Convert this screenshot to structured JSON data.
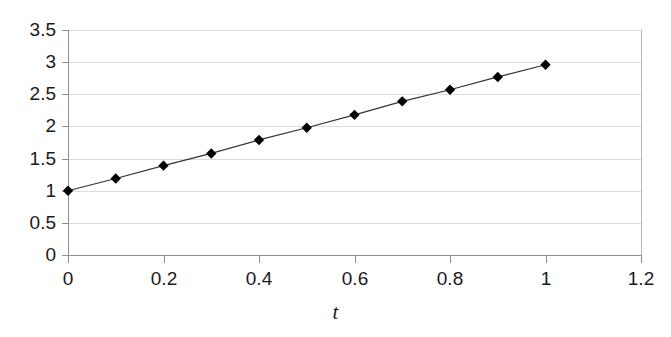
{
  "chart_data": {
    "type": "line",
    "title": "",
    "subtitle": "",
    "xlabel": "t",
    "ylabel": "",
    "xlim": [
      0,
      1.2
    ],
    "ylim": [
      0,
      3.5
    ],
    "xticks": [
      0,
      0.2,
      0.4,
      0.6,
      0.8,
      1,
      1.2
    ],
    "xtick_labels": [
      "0",
      "0.2",
      "0.4",
      "0.6",
      "0.8",
      "1",
      "1.2"
    ],
    "yticks": [
      0,
      0.5,
      1,
      1.5,
      2,
      2.5,
      3,
      3.5
    ],
    "ytick_labels": [
      "0",
      "0.5",
      "1",
      "1.5",
      "2",
      "2.5",
      "3",
      "3.5"
    ],
    "grid": "horizontal",
    "legend": "none",
    "marker": "diamond",
    "marker_color": "#000000",
    "line_color": "#333333",
    "x": [
      0,
      0.1,
      0.2,
      0.3,
      0.4,
      0.5,
      0.6,
      0.7,
      0.8,
      0.9,
      1
    ],
    "series": [
      {
        "name": "",
        "values": [
          1,
          1.19,
          1.39,
          1.58,
          1.79,
          1.98,
          2.18,
          2.39,
          2.57,
          2.77,
          2.96
        ]
      }
    ]
  },
  "colors": {
    "background": "#ffffff",
    "axis": "#8f8f8f",
    "grid": "#dcdcdc",
    "text": "#1a1a1a",
    "marker": "#000000",
    "line": "#333333"
  }
}
